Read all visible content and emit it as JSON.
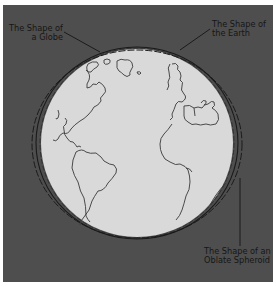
{
  "figure": {
    "labels": {
      "globe": {
        "line1": "The Shape of",
        "line2": "a Globe"
      },
      "earth": {
        "line1": "The Shape of",
        "line2": "the Earth"
      },
      "spheroid": {
        "line1": "The Shape of an",
        "line2": "Oblate Spheroid"
      }
    },
    "colors": {
      "background": "#4e4e4e",
      "globe_fill": "#d9d9d9",
      "outline": "#111111",
      "border": "#ffffff"
    }
  }
}
